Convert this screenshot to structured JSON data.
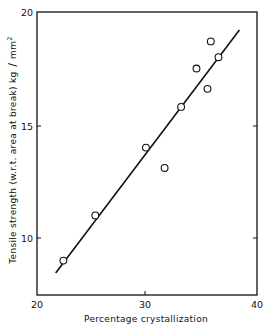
{
  "chart_data": {
    "type": "scatter",
    "title": "",
    "xlabel": "Percentage crystallization",
    "ylabel": "Tensile strength (w.r.t. area at break) kg/mm²",
    "xlim": [
      20,
      40
    ],
    "ylim": [
      7.5,
      20
    ],
    "xticks": [
      20,
      30,
      40
    ],
    "yticks": [
      10,
      15,
      20
    ],
    "grid": false,
    "legend": null,
    "series": [
      {
        "name": "measured",
        "marker": "open-circle",
        "points": [
          {
            "x": 22.4,
            "y": 9.0
          },
          {
            "x": 25.3,
            "y": 11.0
          },
          {
            "x": 29.9,
            "y": 14.0
          },
          {
            "x": 31.6,
            "y": 13.1
          },
          {
            "x": 33.1,
            "y": 15.8
          },
          {
            "x": 34.5,
            "y": 17.5
          },
          {
            "x": 35.5,
            "y": 16.6
          },
          {
            "x": 35.8,
            "y": 18.7
          },
          {
            "x": 36.5,
            "y": 18.0
          }
        ]
      },
      {
        "name": "fit line",
        "style": "solid-line",
        "points": [
          {
            "x": 21.7,
            "y": 8.45
          },
          {
            "x": 38.4,
            "y": 19.2
          }
        ]
      }
    ]
  },
  "labels": {
    "x_axis_title": "Percentage crystallization",
    "y_axis_title_main": "Tensile strength (w.r.t. area at break)  kg",
    "y_axis_title_unit": "mm",
    "y_axis_title_sup": "2",
    "x_ticks": [
      "20",
      "30",
      "40"
    ],
    "y_ticks": [
      "10",
      "15",
      "20"
    ]
  }
}
